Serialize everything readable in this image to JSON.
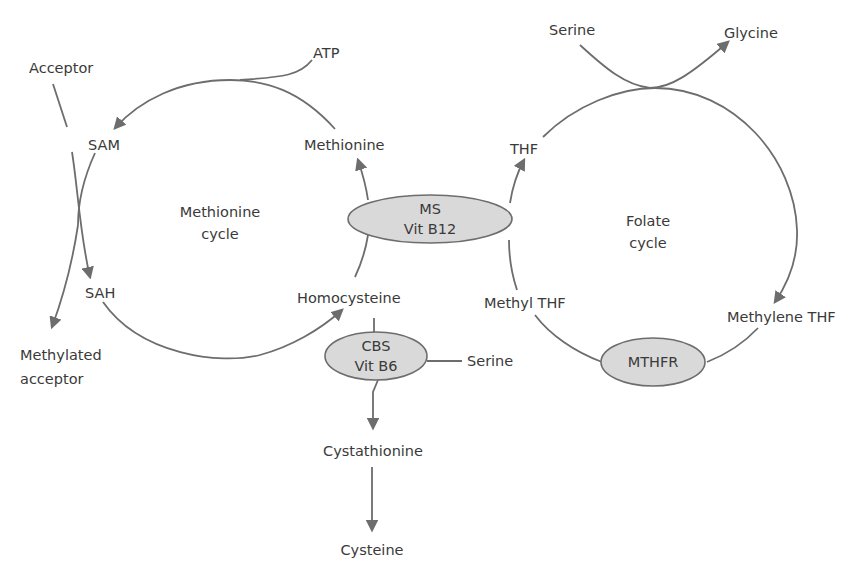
{
  "diagram": {
    "type": "metabolic-pathway",
    "cycles": {
      "methionine": {
        "line1": "Methionine",
        "line2": "cycle"
      },
      "folate": {
        "line1": "Folate",
        "line2": "cycle"
      }
    },
    "metabolites": {
      "acceptor": "Acceptor",
      "atp": "ATP",
      "sam": "SAM",
      "methionine": "Methionine",
      "sah": "SAH",
      "homocysteine": "Homocysteine",
      "methylated_acceptor_1": "Methylated",
      "methylated_acceptor_2": "acceptor",
      "serine_top": "Serine",
      "glycine": "Glycine",
      "thf": "THF",
      "methyl_thf": "Methyl THF",
      "methylene_thf": "Methylene THF",
      "serine_cbs": "Serine",
      "cystathionine": "Cystathionine",
      "cysteine": "Cysteine"
    },
    "enzymes": {
      "ms": {
        "line1": "MS",
        "line2": "Vit B12"
      },
      "cbs": {
        "line1": "CBS",
        "line2": "Vit B6"
      },
      "mthfr": {
        "line1": "MTHFR"
      }
    },
    "colors": {
      "line": "#6d6d6d",
      "enzyme_fill": "#d9d9d9",
      "text": "#3a3a3a"
    }
  }
}
